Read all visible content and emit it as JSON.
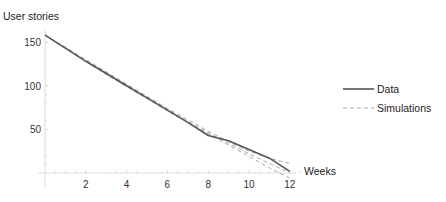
{
  "chart_data": {
    "type": "line",
    "title": "",
    "xlabel": "Weeks",
    "ylabel": "User stories",
    "xlim": [
      0,
      12
    ],
    "ylim": [
      -8,
      165
    ],
    "xticks": [
      2,
      4,
      6,
      8,
      10,
      12
    ],
    "yticks": [
      50,
      100,
      150
    ],
    "grid": false,
    "legend_position": "right",
    "x": [
      0,
      1,
      2,
      3,
      4,
      5,
      6,
      7,
      8,
      9,
      10,
      11,
      12
    ],
    "series": [
      {
        "name": "Data",
        "style": "solid",
        "color": "#555555",
        "values": [
          158,
          143,
          128,
          114,
          100,
          86,
          72,
          58,
          43,
          37,
          27,
          17,
          2
        ]
      },
      {
        "name": "Simulations",
        "style": "dashed",
        "color": "#aaaaaa",
        "values": [
          158,
          144,
          130,
          116,
          102,
          88,
          74,
          61,
          48,
          36,
          25,
          17,
          11
        ]
      },
      {
        "name": "Simulations",
        "style": "dashed",
        "color": "#aaaaaa",
        "values": [
          158,
          143,
          128,
          113,
          99,
          85,
          71,
          58,
          45,
          32,
          19,
          6,
          -6
        ]
      },
      {
        "name": "Simulations",
        "style": "dashed",
        "color": "#aaaaaa",
        "values": [
          158,
          144,
          129,
          115,
          101,
          87,
          73,
          59,
          46,
          34,
          22,
          11,
          0
        ]
      }
    ]
  },
  "labels": {
    "ylabel": "User stories",
    "xlabel": "Weeks",
    "yticks": [
      "50",
      "100",
      "150"
    ],
    "xticks": [
      "2",
      "4",
      "6",
      "8",
      "10",
      "12"
    ]
  },
  "legend": {
    "items": [
      {
        "label": "Data",
        "style": "solid",
        "color": "#555555"
      },
      {
        "label": "Simulations",
        "style": "dashed",
        "color": "#aaaaaa"
      }
    ]
  }
}
